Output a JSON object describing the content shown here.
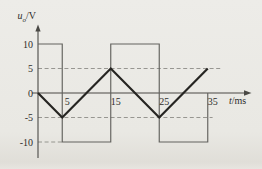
{
  "figure": {
    "background": "#e9e8e3",
    "axis_color": "#4a4945",
    "tick_text_color": "#2e2d2b",
    "square_wave_color": "#63625e",
    "triangle_wave_color": "#262522",
    "dash_color": "#8d8c87"
  },
  "chart_data": {
    "type": "line",
    "title": "",
    "ylabel": "u_o/V",
    "ylabel_var": "u",
    "ylabel_sub": "o",
    "ylabel_unit": "/V",
    "xlabel": "t/ms",
    "xlabel_var": "t",
    "xlabel_unit": "/ms",
    "x_ticks": [
      5,
      15,
      25,
      35
    ],
    "y_ticks": [
      10,
      5,
      0,
      -5,
      -10
    ],
    "xlim": [
      0,
      43
    ],
    "ylim": [
      -13,
      14
    ],
    "grid": "dashed-guides-only",
    "legend": "none",
    "series": [
      {
        "name": "square-wave",
        "description": "square wave, +/-10 V, transitions at t = 5, 15, 25, 35 ms",
        "style": "thin",
        "points": [
          [
            0,
            10
          ],
          [
            5,
            10
          ],
          [
            5,
            -10
          ],
          [
            15,
            -10
          ],
          [
            15,
            10
          ],
          [
            25,
            10
          ],
          [
            25,
            -10
          ],
          [
            35,
            -10
          ],
          [
            35,
            0
          ]
        ]
      },
      {
        "name": "triangle-wave",
        "description": "triangle wave, +/-5 V, period 20 ms, starts at 0 going negative",
        "style": "thick",
        "points": [
          [
            0,
            0
          ],
          [
            5,
            -5
          ],
          [
            15,
            5
          ],
          [
            25,
            -5
          ],
          [
            35,
            5
          ]
        ]
      }
    ],
    "dashed_guides": [
      {
        "v": 5,
        "t0": 0,
        "t1": 38
      },
      {
        "v": -5,
        "t0": 0,
        "t1": 36
      },
      {
        "v": -10,
        "t0": 0,
        "t1": 5
      }
    ]
  }
}
